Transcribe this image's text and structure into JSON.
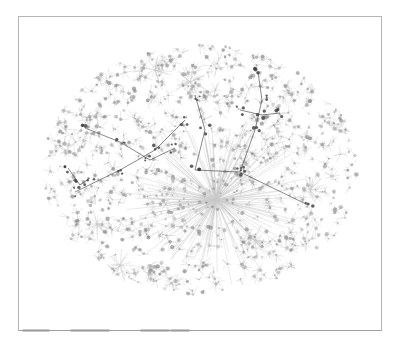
{
  "figure": {
    "type": "network-graph",
    "colors": {
      "background": "#ffffff",
      "frame": "#b5b5b5",
      "edges": "#9c9c9c",
      "nodes": "#8a8a8a",
      "dark_branches": "#3a3a3a"
    },
    "cloud": {
      "cx": 200,
      "cy": 170,
      "rx": 158,
      "ry": 125
    },
    "hub": {
      "x": 216,
      "y": 200
    },
    "secondary_hubs": [
      {
        "x": 155,
        "y": 70
      },
      {
        "x": 97,
        "y": 224
      },
      {
        "x": 190,
        "y": 82
      },
      {
        "x": 310,
        "y": 190
      },
      {
        "x": 255,
        "y": 240
      },
      {
        "x": 120,
        "y": 265
      }
    ],
    "dark_branches": [
      [
        [
          75,
          192
        ],
        [
          120,
          170
        ],
        [
          155,
          150
        ],
        [
          185,
          120
        ]
      ],
      [
        [
          85,
          128
        ],
        [
          120,
          142
        ],
        [
          150,
          160
        ],
        [
          175,
          148
        ]
      ],
      [
        [
          195,
          95
        ],
        [
          205,
          130
        ],
        [
          195,
          170
        ],
        [
          240,
          172
        ],
        [
          308,
          205
        ]
      ],
      [
        [
          240,
          172
        ],
        [
          255,
          130
        ],
        [
          262,
          100
        ],
        [
          258,
          72
        ]
      ],
      [
        [
          240,
          110
        ],
        [
          262,
          115
        ],
        [
          280,
          113
        ]
      ],
      [
        [
          68,
          168
        ],
        [
          80,
          185
        ],
        [
          90,
          178
        ]
      ]
    ]
  }
}
